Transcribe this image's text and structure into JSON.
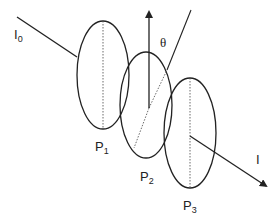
{
  "diagram": {
    "incident_beam": {
      "label": "I",
      "subscript": "0"
    },
    "output_beam": {
      "label": "I"
    },
    "angle_label": "θ",
    "polarizers": [
      {
        "label": "P",
        "subscript": "1",
        "axis": "vertical"
      },
      {
        "label": "P",
        "subscript": "2",
        "axis": "rotated by θ"
      },
      {
        "label": "P",
        "subscript": "3",
        "axis": "vertical"
      }
    ],
    "colors": {
      "stroke": "#222222",
      "background": "#ffffff"
    }
  }
}
